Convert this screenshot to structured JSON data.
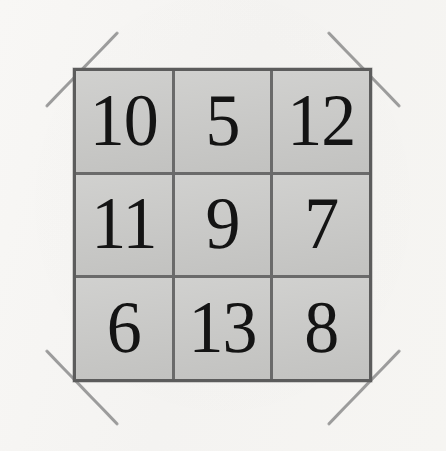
{
  "image": {
    "kind": "scanned-number-grid",
    "background_color": "#f6f5f3"
  },
  "grid": {
    "rows": 3,
    "columns": 3,
    "cell_fill_color": "#c9c9c7",
    "border_color": "#5c5c5c",
    "number_color": "#141414",
    "cells": [
      {
        "label": "10",
        "row": 1,
        "column": 1
      },
      {
        "label": "5",
        "row": 1,
        "column": 2
      },
      {
        "label": "12",
        "row": 1,
        "column": 3
      },
      {
        "label": "11",
        "row": 2,
        "column": 1
      },
      {
        "label": "9",
        "row": 2,
        "column": 2
      },
      {
        "label": "7",
        "row": 2,
        "column": 3
      },
      {
        "label": "6",
        "row": 3,
        "column": 1
      },
      {
        "label": "13",
        "row": 3,
        "column": 2
      },
      {
        "label": "8",
        "row": 3,
        "column": 3
      }
    ]
  },
  "corner_marks": {
    "color": "#8e8e8e",
    "items": [
      {
        "position": "top-left"
      },
      {
        "position": "top-right"
      },
      {
        "position": "bottom-left"
      },
      {
        "position": "bottom-right"
      }
    ]
  }
}
